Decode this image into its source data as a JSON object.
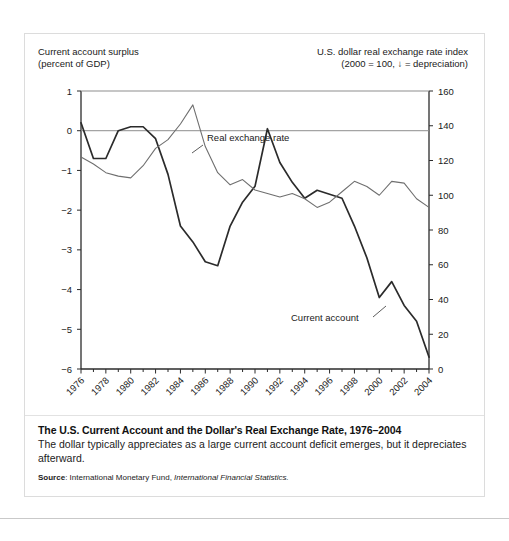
{
  "figure": {
    "left_axis_caption": "Current account surplus\n(percent of GDP)",
    "right_axis_caption": "U.S. dollar real exchange rate index\n(2000  = 100, ↓ = depreciation)",
    "caption_title": "The U.S. Current Account and the Dollar's Real Exchange Rate, 1976–2004",
    "caption_body": "The dollar typically appreciates as a large current account deficit emerges, but it depreciates afterward.",
    "source_label": "Source",
    "source_sep": ": ",
    "source_org": "International Monetary Fund, ",
    "source_publication": "International Financial Statistics."
  },
  "chart_data": {
    "type": "line",
    "title": "The U.S. Current Account and the Dollar's Real Exchange Rate, 1976–2004",
    "xlabel": "",
    "ylabel": "Current account surplus (percent of GDP)",
    "y2label": "U.S. dollar real exchange rate index (2000 = 100, ↓ = depreciation)",
    "xlim": [
      1976,
      2004
    ],
    "ylim": [
      -6,
      1
    ],
    "y2lim": [
      0,
      160
    ],
    "grid": false,
    "zero_line": true,
    "legend": "inline-annotations",
    "x": [
      1976,
      1977,
      1978,
      1979,
      1980,
      1981,
      1982,
      1983,
      1984,
      1985,
      1986,
      1987,
      1988,
      1989,
      1990,
      1991,
      1992,
      1993,
      1994,
      1995,
      1996,
      1997,
      1998,
      1999,
      2000,
      2001,
      2002,
      2003,
      2004
    ],
    "xticks": [
      1976,
      1978,
      1980,
      1982,
      1984,
      1986,
      1988,
      1990,
      1992,
      1994,
      1996,
      1998,
      2000,
      2002,
      2004
    ],
    "xticklabels": [
      "1976",
      "1978",
      "1980",
      "1982",
      "1984",
      "1986",
      "1988",
      "1990",
      "1992",
      "1994",
      "1996",
      "1998",
      "2000",
      "2002",
      "2004"
    ],
    "yticks": [
      1,
      0,
      -1,
      -2,
      -3,
      -4,
      -5,
      -6
    ],
    "yticklabels": [
      "1",
      "0",
      "−1",
      "−2",
      "−3",
      "−4",
      "−5",
      "−6"
    ],
    "y2ticks": [
      0,
      20,
      40,
      60,
      80,
      100,
      120,
      140,
      160
    ],
    "y2ticklabels": [
      "0",
      "20",
      "40",
      "60",
      "80",
      "100",
      "120",
      "140",
      "160"
    ],
    "series": [
      {
        "name": "Current account",
        "axis": "left",
        "label_text": "Current account",
        "color": "#2b2b2b",
        "width": 1.7,
        "values": [
          0.2,
          -0.7,
          -0.7,
          0.0,
          0.1,
          0.1,
          -0.2,
          -1.1,
          -2.4,
          -2.8,
          -3.3,
          -3.4,
          -2.4,
          -1.8,
          -1.4,
          0.05,
          -0.8,
          -1.3,
          -1.7,
          -1.5,
          -1.6,
          -1.7,
          -2.4,
          -3.2,
          -4.2,
          -3.8,
          -4.4,
          -4.8,
          -5.7
        ]
      },
      {
        "name": "Real exchange rate",
        "axis": "right",
        "label_text": "Real exchange rate",
        "color": "#6f6f6f",
        "width": 1.1,
        "values": [
          122,
          118,
          113,
          111,
          110,
          117,
          127,
          132,
          141,
          152,
          128,
          113,
          106,
          109,
          103,
          101,
          99,
          101,
          98,
          93,
          96,
          102,
          108,
          105,
          100,
          108,
          107,
          98,
          93
        ]
      }
    ],
    "annotations": [
      {
        "text": "Real exchange rate",
        "for": "Real exchange rate",
        "text_x": 182,
        "text_y": 107,
        "leader": [
          [
            178,
            111
          ],
          [
            167,
            119
          ]
        ]
      },
      {
        "text": "Current account",
        "for": "Current account",
        "text_x": 266,
        "text_y": 287,
        "leader": [
          [
            348,
            283
          ],
          [
            361,
            272
          ]
        ]
      }
    ]
  }
}
